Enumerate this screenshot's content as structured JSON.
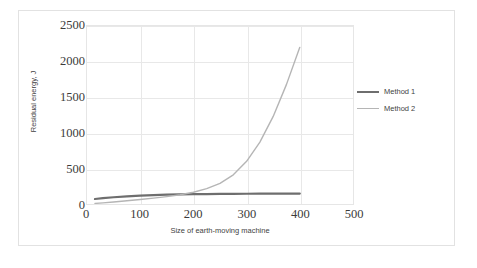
{
  "chart_data": {
    "type": "line",
    "title": "",
    "xlabel": "Size of earth-moving machine",
    "ylabel": "Residual energy, J",
    "xlim": [
      0,
      500
    ],
    "ylim": [
      0,
      2500
    ],
    "xticks": [
      0,
      100,
      200,
      300,
      400,
      500
    ],
    "yticks": [
      0,
      500,
      1000,
      1500,
      2000,
      2500
    ],
    "grid": true,
    "legend_position": "right",
    "series": [
      {
        "name": "Method 1",
        "color": "#6e6e6e",
        "x": [
          15,
          30,
          50,
          75,
          100,
          125,
          150,
          175,
          200,
          225,
          250,
          275,
          300,
          325,
          350,
          375,
          400
        ],
        "values": [
          70,
          82,
          95,
          108,
          118,
          125,
          131,
          135,
          138,
          140,
          142,
          143,
          144,
          145,
          146,
          146,
          147
        ]
      },
      {
        "name": "Method 2",
        "color": "#b5b5b5",
        "x": [
          15,
          30,
          50,
          75,
          100,
          125,
          150,
          175,
          200,
          225,
          250,
          275,
          300,
          325,
          350,
          375,
          400
        ],
        "values": [
          8,
          16,
          28,
          45,
          63,
          82,
          104,
          130,
          165,
          215,
          290,
          410,
          600,
          870,
          1230,
          1680,
          2200
        ]
      }
    ]
  },
  "axis": {
    "y_tick_labels": [
      "0",
      "500",
      "1000",
      "1500",
      "2000",
      "2500"
    ],
    "x_tick_labels": [
      "0",
      "100",
      "200",
      "300",
      "400",
      "500"
    ],
    "y_title": "Residual energy, J",
    "x_title": "Size of earth-moving machine"
  },
  "legend": {
    "entries": [
      {
        "label": "Method 1",
        "color": "#6e6e6e",
        "width": "2.2px"
      },
      {
        "label": "Method 2",
        "color": "#b5b5b5",
        "width": "1.4px"
      }
    ]
  },
  "colors": {
    "method_1": "#6e6e6e",
    "method_2": "#b5b5b5",
    "gridline": "#e8e8e8",
    "plot_border": "#e6e6e6",
    "frame_border": "#e2e2e2",
    "background": "#ffffff",
    "text": "#3b3b3b"
  }
}
